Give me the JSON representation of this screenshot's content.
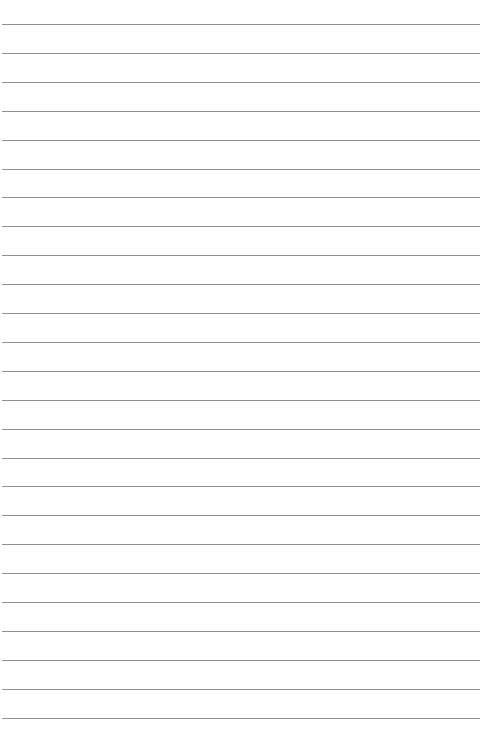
{
  "page": {
    "type": "lined-paper",
    "background_color": "#ffffff",
    "line_color": "#8f8f8f",
    "line_count": 25,
    "first_line_y": 24,
    "line_spacing": 28.9
  }
}
